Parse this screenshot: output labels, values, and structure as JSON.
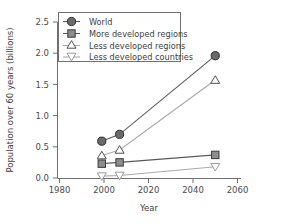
{
  "chart_data": {
    "type": "line",
    "title": "",
    "xlabel": "Year",
    "ylabel": "Population over 60 years  (billions)",
    "xlim": [
      1980,
      2060
    ],
    "ylim": [
      0.0,
      2.5
    ],
    "xticks": [
      1980,
      2000,
      2020,
      2040,
      2060
    ],
    "xtick_labels": [
      "1980",
      "2000",
      "2020",
      "2040",
      "2060"
    ],
    "yticks": [
      0.0,
      0.5,
      1.0,
      1.5,
      2.0,
      2.5
    ],
    "ytick_labels": [
      "0.0",
      "0.5",
      "1.0",
      "1.5",
      "2.0",
      "2.5"
    ],
    "grid": false,
    "legend_position": "top-left",
    "x": [
      1999,
      2007,
      2050
    ],
    "series": [
      {
        "name": "World",
        "marker": "circle-filled",
        "color": "#6a6a6a",
        "line_color": "#5a5a5a",
        "values": [
          0.59,
          0.7,
          1.96
        ]
      },
      {
        "name": "More developed regions",
        "marker": "square-filled",
        "color": "#8d8d8d",
        "line_color": "#5a5a5a",
        "values": [
          0.23,
          0.25,
          0.37
        ]
      },
      {
        "name": "Less developed regions",
        "marker": "triangle-up-open",
        "color": "#ffffff",
        "line_color": "#a9a9a9",
        "values": [
          0.36,
          0.45,
          1.57
        ]
      },
      {
        "name": "Less developed countries",
        "marker": "triangle-down-open",
        "color": "#ffffff",
        "line_color": "#a9a9a9",
        "values": [
          0.03,
          0.04,
          0.18
        ]
      }
    ]
  },
  "legend": {
    "items": [
      {
        "label": "World",
        "icon": "circle-filled-marker-icon"
      },
      {
        "label": "More developed regions",
        "icon": "square-filled-marker-icon"
      },
      {
        "label": "Less developed regions",
        "icon": "triangle-up-open-marker-icon"
      },
      {
        "label": "Less developed countries",
        "icon": "triangle-down-open-marker-icon"
      }
    ]
  },
  "axes": {
    "x_title": "Year",
    "y_title": "Population over 60 years  (billions)",
    "x_tick_labels": [
      "1980",
      "2000",
      "2020",
      "2040",
      "2060"
    ],
    "y_tick_labels": [
      "0.0",
      "0.5",
      "1.0",
      "1.5",
      "2.0",
      "2.5"
    ]
  }
}
